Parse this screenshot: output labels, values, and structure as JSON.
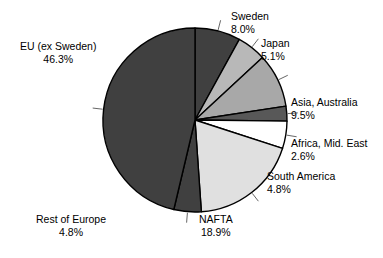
{
  "chart_data": {
    "type": "pie",
    "title": "",
    "subtitle": "",
    "xlabel": "",
    "ylabel": "",
    "legend_position": "none",
    "labels_position": "outside-with-leader-lines",
    "start_angle_deg": 0,
    "direction": "clockwise",
    "units": "percent",
    "categories": [
      "Sweden",
      "Japan",
      "Asia, Australia",
      "Africa, Mid. East",
      "South America",
      "NAFTA",
      "Rest of Europe",
      "EU (ex Sweden)"
    ],
    "values": [
      8.0,
      5.1,
      9.5,
      2.6,
      4.8,
      18.9,
      4.8,
      46.3
    ],
    "value_labels": [
      "8.0%",
      "5.1%",
      "9.5%",
      "2.6%",
      "4.8%",
      "18.9%",
      "4.8%",
      "46.3%"
    ],
    "colors": [
      "#404040",
      "#b8b8b8",
      "#a8a8a8",
      "#585858",
      "#ffffff",
      "#e0e0e0",
      "#404040",
      "#404040"
    ],
    "slices": [
      {
        "label": "Sweden",
        "value": 8.0,
        "value_label": "8.0%",
        "color": "#404040"
      },
      {
        "label": "Japan",
        "value": 5.1,
        "value_label": "5.1%",
        "color": "#b8b8b8"
      },
      {
        "label": "Asia, Australia",
        "value": 9.5,
        "value_label": "9.5%",
        "color": "#a8a8a8"
      },
      {
        "label": "Africa, Mid. East",
        "value": 2.6,
        "value_label": "2.6%",
        "color": "#585858"
      },
      {
        "label": "South America",
        "value": 4.8,
        "value_label": "4.8%",
        "color": "#ffffff"
      },
      {
        "label": "NAFTA",
        "value": 18.9,
        "value_label": "18.9%",
        "color": "#e0e0e0"
      },
      {
        "label": "Rest of Europe",
        "value": 4.8,
        "value_label": "4.8%",
        "color": "#404040"
      },
      {
        "label": "EU (ex Sweden)",
        "value": 46.3,
        "value_label": "46.3%",
        "color": "#404040"
      }
    ]
  },
  "geometry": {
    "cx": 195,
    "cy": 120,
    "r": 92,
    "outline_color": "#000000"
  }
}
